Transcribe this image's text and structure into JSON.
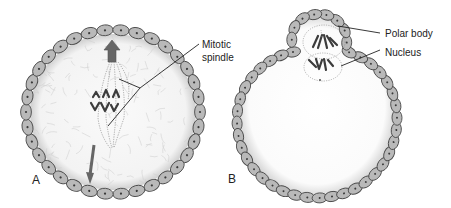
{
  "figure": {
    "panels": [
      {
        "id": "A",
        "letter": "A",
        "description": "Oocyte in metaphase with mitotic spindle, surrounded by follicle cells",
        "labels": [
          {
            "line1": "Mitotic",
            "line2": "spindle"
          }
        ]
      },
      {
        "id": "B",
        "letter": "B",
        "description": "Oocyte extruding polar body with nucleus below",
        "labels": [
          {
            "text": "Polar body"
          },
          {
            "text": "Nucleus"
          }
        ]
      }
    ],
    "colors": {
      "cell_fill": "#b9b9b9",
      "cell_stroke": "#4a4a4a",
      "cytoplasm": "#f4f4f4",
      "texture": "#d2d2d2",
      "arrow": "#666666",
      "text": "#222222"
    }
  }
}
